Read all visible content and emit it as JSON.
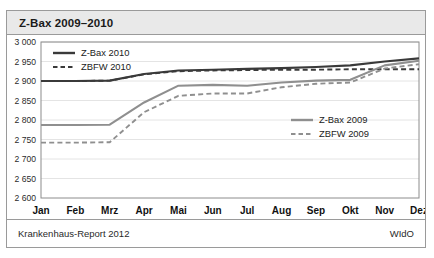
{
  "figure": {
    "title": "Z-Bax 2009–2010",
    "footer_left": "Krankenhaus-Report 2012",
    "footer_right": "WIdO"
  },
  "colors": {
    "series_2010": "#3a3a3a",
    "series_2009": "#8f8f8f",
    "grid": "#e4e4e4",
    "axis": "#8c8c8c",
    "title_bg": "#e9e9e9",
    "border": "#9a9a9a"
  },
  "legend_top": {
    "position": "top-left",
    "entries": [
      {
        "label": "Z-Bax 2010",
        "style": "solid",
        "color": "#3a3a3a"
      },
      {
        "label": "ZBFW 2010",
        "style": "dashed",
        "color": "#3a3a3a"
      }
    ]
  },
  "legend_bottom": {
    "position": "mid-right",
    "entries": [
      {
        "label": "Z-Bax 2009",
        "style": "solid",
        "color": "#8f8f8f"
      },
      {
        "label": "ZBFW 2009",
        "style": "dashed",
        "color": "#8f8f8f"
      }
    ]
  },
  "chart_data": {
    "type": "line",
    "title": "Z-Bax 2009–2010",
    "xlabel": "",
    "ylabel": "",
    "grid": true,
    "ylim": [
      2600,
      3000
    ],
    "ytick_step": 50,
    "ytick_labels": [
      "3 000",
      "2 950",
      "2 900",
      "2 850",
      "2 800",
      "2 750",
      "2 700",
      "2 650",
      "2 600"
    ],
    "ytick_values": [
      3000,
      2950,
      2900,
      2850,
      2800,
      2750,
      2700,
      2650,
      2600
    ],
    "categories": [
      "Jan",
      "Feb",
      "Mrz",
      "Apr",
      "Mai",
      "Jun",
      "Jul",
      "Aug",
      "Sep",
      "Okt",
      "Nov",
      "Dez"
    ],
    "series": [
      {
        "name": "Z-Bax 2010",
        "style": "solid",
        "color": "#3a3a3a",
        "values": [
          2900,
          2900,
          2901,
          2918,
          2927,
          2929,
          2931,
          2933,
          2936,
          2940,
          2950,
          2958
        ]
      },
      {
        "name": "ZBFW 2010",
        "style": "dashed",
        "color": "#3a3a3a",
        "values": [
          2900,
          2900,
          2901,
          2917,
          2925,
          2927,
          2928,
          2929,
          2929,
          2930,
          2930,
          2930
        ]
      },
      {
        "name": "Z-Bax 2009",
        "style": "solid",
        "color": "#8f8f8f",
        "values": [
          2787,
          2787,
          2788,
          2845,
          2888,
          2890,
          2888,
          2896,
          2901,
          2903,
          2940,
          2952
        ]
      },
      {
        "name": "ZBFW 2009",
        "style": "dashed",
        "color": "#8f8f8f",
        "values": [
          2742,
          2742,
          2743,
          2820,
          2862,
          2868,
          2868,
          2884,
          2893,
          2896,
          2932,
          2943
        ]
      }
    ]
  }
}
